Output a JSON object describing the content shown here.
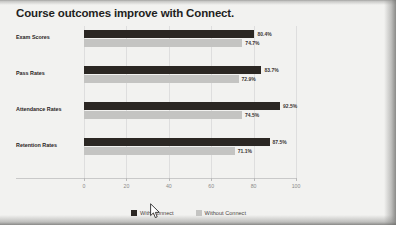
{
  "slide": {
    "title": "Course outcomes improve with Connect."
  },
  "colors": {
    "with_connect": "#2b2723",
    "without_connect": "#c4c4c2",
    "slide_background": "#f2f2f0",
    "title_text": "#231f1e",
    "gridline": "#dedede"
  },
  "legend": {
    "items": [
      {
        "label": "With Connect",
        "swatch": "#2b2723"
      },
      {
        "label": "Without Connect",
        "swatch": "#c4c4c2"
      }
    ]
  },
  "axis": {
    "ticks": [
      "0",
      "20",
      "40",
      "60",
      "80",
      "100"
    ]
  },
  "chart_data": {
    "type": "bar",
    "orientation": "horizontal",
    "title": "Course outcomes improve with Connect.",
    "xlabel": "",
    "ylabel": "",
    "xlim": [
      0,
      100
    ],
    "grid": true,
    "legend_position": "bottom",
    "categories": [
      "Exam Scores",
      "Pass Rates",
      "Attendance Rates",
      "Retention Rates"
    ],
    "series": [
      {
        "name": "With Connect",
        "color": "#2b2723",
        "values": [
          80.4,
          83.7,
          92.5,
          87.5
        ],
        "value_labels": [
          "80.4%",
          "83.7%",
          "92.5%",
          "87.5%"
        ]
      },
      {
        "name": "Without Connect",
        "color": "#c4c4c2",
        "values": [
          74.7,
          72.9,
          74.5,
          71.1
        ],
        "value_labels": [
          "74.7%",
          "72.9%",
          "74.5%",
          "71.1%"
        ]
      }
    ]
  },
  "cursor": {
    "icon": "mouse-pointer-icon"
  }
}
